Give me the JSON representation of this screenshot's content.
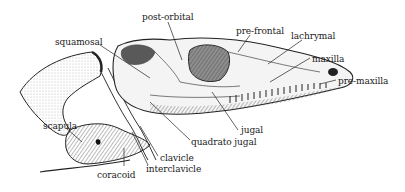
{
  "diagram": {
    "type": "anatomical illustration",
    "labels": [
      {
        "id": "post-orbital",
        "text": "post-orbital",
        "x": 142,
        "y": 12
      },
      {
        "id": "pre-frontal",
        "text": "pre-frontal",
        "x": 236,
        "y": 26
      },
      {
        "id": "lachrymal",
        "text": "lachrymal",
        "x": 291,
        "y": 31
      },
      {
        "id": "squamosal",
        "text": "squamosal",
        "x": 55,
        "y": 37
      },
      {
        "id": "maxilla",
        "text": "maxilla",
        "x": 312,
        "y": 54
      },
      {
        "id": "pre-maxilla",
        "text": "pre-maxilla",
        "x": 338,
        "y": 76
      },
      {
        "id": "scapula",
        "text": "scapula",
        "x": 43,
        "y": 121
      },
      {
        "id": "jugal",
        "text": "jugal",
        "x": 241,
        "y": 125
      },
      {
        "id": "quadrato-jugal",
        "text": "quadrato jugal",
        "x": 191,
        "y": 137
      },
      {
        "id": "clavicle",
        "text": "clavicle",
        "x": 160,
        "y": 153
      },
      {
        "id": "interclavicle",
        "text": "interclavicle",
        "x": 146,
        "y": 164
      },
      {
        "id": "coracoid",
        "text": "coracoid",
        "x": 97,
        "y": 170
      }
    ]
  }
}
